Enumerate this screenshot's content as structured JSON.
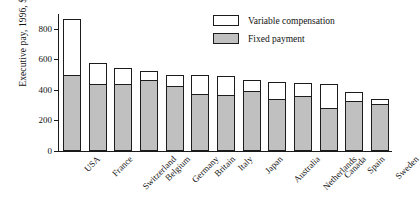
{
  "chart_data": {
    "type": "bar",
    "subtype": "stacked-vertical",
    "title": "",
    "xlabel": "",
    "ylabel": "Executive pay, 1996, $000",
    "ylim": [
      0,
      900
    ],
    "yticks": [
      0,
      200,
      400,
      600,
      800
    ],
    "grid": false,
    "legend_position": "top-right",
    "categories": [
      "USA",
      "France",
      "Switzerland",
      "Belgium",
      "Germany",
      "Britain",
      "Italy",
      "Japan",
      "Australia",
      "Netherlands",
      "Canada",
      "Spain",
      "Sweden"
    ],
    "series": [
      {
        "name": "Variable compensation",
        "color": "#ffffff",
        "values": [
          370,
          140,
          105,
          60,
          75,
          125,
          125,
          70,
          115,
          90,
          155,
          60,
          30
        ]
      },
      {
        "name": "Fixed payment",
        "color": "#c0c0c0",
        "values": [
          500,
          440,
          440,
          465,
          425,
          375,
          370,
          395,
          340,
          360,
          285,
          330,
          310
        ]
      }
    ],
    "totals": [
      870,
      580,
      545,
      525,
      500,
      500,
      495,
      465,
      455,
      450,
      440,
      390,
      340
    ],
    "stack_order_top_to_bottom": [
      "Variable compensation",
      "Fixed payment"
    ]
  },
  "axis": {
    "y_title": "Executive pay, 1996, $000",
    "y_tick_labels": [
      "800",
      "600",
      "400",
      "200",
      "0"
    ]
  },
  "legend": {
    "items": [
      {
        "label": "Variable compensation",
        "swatch": "white-swatch"
      },
      {
        "label": "Fixed payment",
        "swatch": "gray-swatch"
      }
    ]
  },
  "colors": {
    "fixed": "#c0c0c0",
    "variable": "#ffffff",
    "outline": "#1c1c1c",
    "background": "#ffffff"
  }
}
